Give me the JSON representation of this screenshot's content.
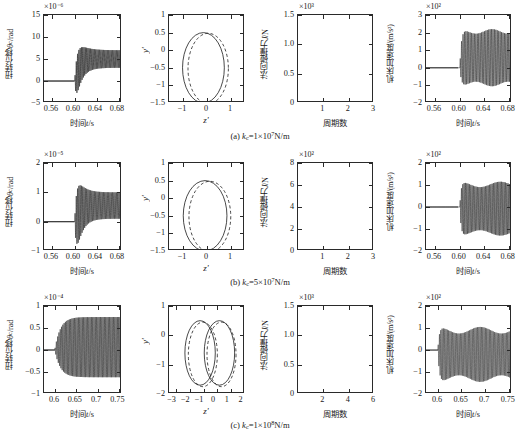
{
  "figure": {
    "columns": [
      "torsional-displacement",
      "phase-portrait",
      "normal-impact-force",
      "machine-acceleration"
    ],
    "rows": [
      "a",
      "b",
      "c"
    ]
  },
  "captions": {
    "a": "(a) kc=1×10⁷N/m",
    "b": "(b) kc=5×10⁷N/m",
    "c": "(c) kc=1×10⁸N/m",
    "a_prefix": "(a) ",
    "a_sym": "k",
    "a_sub": "c",
    "a_rest": "=1×10",
    "a_sup": "7",
    "a_unit": "N/m",
    "b_prefix": "(b) ",
    "b_sym": "k",
    "b_sub": "c",
    "b_rest": "=5×10",
    "b_sup": "7",
    "b_unit": "N/m",
    "c_prefix": "(c) ",
    "c_sym": "k",
    "c_sub": "c",
    "c_rest": "=1×10",
    "c_sup": "8",
    "c_unit": "N/m"
  },
  "labels": {
    "y_torsion": "扭转位移θc/rad",
    "y_torsion_cn": "扭转位移",
    "y_torsion_sym": "θ",
    "y_torsion_sub": "c",
    "y_torsion_unit": "/rad",
    "y_phase": "y'",
    "x_phase": "z'",
    "y_force_cn": "法向碰撞力",
    "y_force_sym": "J",
    "y_force_unit": "/N",
    "x_force": "周期数",
    "y_accel_cn": "机床加速度",
    "y_accel_unit": "/(m/s²)",
    "x_time_cn": "时间",
    "x_time_sym": "t",
    "x_time_unit": "/s"
  },
  "chart_data": [
    {
      "id": "a1",
      "row": "a",
      "col": 1,
      "type": "line",
      "title": "",
      "exponent": "×10⁻⁶",
      "xlabel": "时间t/s",
      "ylabel": "扭转位移θc/rad",
      "xlim": [
        0.545,
        0.685
      ],
      "ylim": [
        -5,
        15
      ],
      "xticks": [
        0.56,
        0.6,
        0.64,
        0.68
      ],
      "xticklabels": [
        "0.56",
        "0.60",
        "0.64",
        "0.68"
      ],
      "yticks": [
        -5,
        0,
        5,
        10,
        15
      ],
      "yticklabels": [
        "−5",
        "0",
        "5",
        "10",
        "15"
      ],
      "grid": false,
      "legend": "none",
      "description": "Flat zero until t=0.600 s, then high-frequency oscillation with initial peak 10.5 decaying to a steady band centered near 5 with amplitude about 2",
      "onset": 0.6,
      "peak_initial": 10.5,
      "steady_center": 5.0,
      "steady_amp": 2.0,
      "freq_hz": 430
    },
    {
      "id": "a2",
      "row": "a",
      "col": 2,
      "type": "line",
      "exponent": "",
      "xlabel": "z'",
      "ylabel": "y'",
      "xlim": [
        -1.6,
        1.6
      ],
      "ylim": [
        -1.5,
        1
      ],
      "xticks": [
        -1,
        0,
        1
      ],
      "xticklabels": [
        "−1",
        "0",
        "1"
      ],
      "yticks": [
        -1.5,
        -1,
        -0.5,
        0,
        0.5,
        1
      ],
      "yticklabels": [
        "−1.5",
        "−1",
        "−0.5",
        "0",
        "0.5",
        "1"
      ],
      "grid": false,
      "legend": "none",
      "series": [
        {
          "name": "solid-orbit",
          "style": "solid",
          "shape": "circle",
          "cx": -0.15,
          "cy": -0.5,
          "rx": 0.88,
          "ry": 1.0
        },
        {
          "name": "dashed-orbit",
          "style": "dashed",
          "shape": "circle",
          "cx": 0.05,
          "cy": -0.52,
          "rx": 0.85,
          "ry": 1.0
        }
      ]
    },
    {
      "id": "a3",
      "row": "a",
      "col": 3,
      "type": "line",
      "exponent": "×10³",
      "xlabel": "周期数",
      "ylabel": "法向碰撞力J/N",
      "xlim": [
        0,
        3
      ],
      "ylim": [
        0,
        1.5
      ],
      "xticks": [
        1,
        2,
        3
      ],
      "xticklabels": [
        "1",
        "2",
        "3"
      ],
      "yticks": [
        0,
        0.5,
        1,
        1.5
      ],
      "yticklabels": [
        "0",
        "0.5",
        "1.0",
        "1.5"
      ],
      "grid": false,
      "legend": "none",
      "pulses": [
        {
          "center": 0.48,
          "peak": 1.01,
          "width": 0.3
        },
        {
          "center": 1.45,
          "peak": 1.01,
          "width": 0.3
        },
        {
          "center": 2.43,
          "peak": 1.01,
          "width": 0.3
        }
      ]
    },
    {
      "id": "a4",
      "row": "a",
      "col": 4,
      "type": "line",
      "exponent": "×10²",
      "xlabel": "时间t/s",
      "ylabel": "机床加速度/(m/s²)",
      "xlim": [
        0.545,
        0.685
      ],
      "ylim": [
        -2,
        3
      ],
      "xticks": [
        0.56,
        0.6,
        0.64,
        0.68
      ],
      "xticklabels": [
        "0.56",
        "0.60",
        "0.64",
        "0.68"
      ],
      "yticks": [
        -2,
        -1,
        0,
        1,
        2,
        3
      ],
      "yticklabels": [
        "−2",
        "−1",
        "0",
        "1",
        "2",
        "3"
      ],
      "grid": false,
      "legend": "none",
      "description": "Zero until 0.600 s then dense oscillation band from about −1.0 to 2.2",
      "onset": 0.6,
      "band_top": 2.2,
      "band_bottom": -1.05,
      "freq_hz": 430
    },
    {
      "id": "b1",
      "row": "b",
      "col": 1,
      "type": "line",
      "exponent": "×10⁻⁵",
      "xlabel": "时间t/s",
      "ylabel": "扭转位移θc/rad",
      "xlim": [
        0.545,
        0.685
      ],
      "ylim": [
        -1,
        2
      ],
      "xticks": [
        0.56,
        0.6,
        0.64,
        0.68
      ],
      "xticklabels": [
        "0.56",
        "0.60",
        "0.64",
        "0.68"
      ],
      "yticks": [
        -1,
        0,
        1,
        2
      ],
      "yticklabels": [
        "−1",
        "0",
        "1",
        "2"
      ],
      "grid": false,
      "legend": "none",
      "description": "Flat zero until 0.600 s, transient burst peaking near 1.78 and dipping to −0.55, settling to band centered 0.55 amplitude 0.45",
      "onset": 0.6,
      "peak_initial": 1.78,
      "trough_initial": -0.55,
      "steady_center": 0.55,
      "steady_amp": 0.45,
      "freq_hz": 430
    },
    {
      "id": "b2",
      "row": "b",
      "col": 2,
      "type": "line",
      "exponent": "",
      "xlabel": "z'",
      "ylabel": "y'",
      "xlim": [
        -1.6,
        1.6
      ],
      "ylim": [
        -1.5,
        1
      ],
      "xticks": [
        -1,
        0,
        1
      ],
      "xticklabels": [
        "−1",
        "0",
        "1"
      ],
      "yticks": [
        -1.5,
        -1,
        -0.5,
        0,
        0.5,
        1
      ],
      "yticklabels": [
        "−1.5",
        "−1",
        "−0.5",
        "0",
        "0.5",
        "1"
      ],
      "grid": false,
      "legend": "none",
      "series": [
        {
          "name": "solid-orbit",
          "style": "solid",
          "shape": "circle",
          "cx": -0.08,
          "cy": -0.5,
          "rx": 0.92,
          "ry": 1.0
        },
        {
          "name": "dashed-orbit",
          "style": "dashed",
          "shape": "circle",
          "cx": 0.12,
          "cy": -0.52,
          "rx": 0.88,
          "ry": 1.0
        }
      ]
    },
    {
      "id": "b3",
      "row": "b",
      "col": 3,
      "type": "line",
      "exponent": "×10²",
      "xlabel": "周期数",
      "ylabel": "法向碰撞力J/N",
      "xlim": [
        0,
        3
      ],
      "ylim": [
        0,
        8
      ],
      "xticks": [
        1,
        2,
        3
      ],
      "xticklabels": [
        "1",
        "2",
        "3"
      ],
      "yticks": [
        0,
        2,
        4,
        6,
        8
      ],
      "yticklabels": [
        "0",
        "2",
        "4",
        "6",
        "8"
      ],
      "grid": false,
      "legend": "none",
      "pulses": [
        {
          "center": 0.47,
          "peak": 6.4,
          "width": 0.28
        },
        {
          "center": 1.45,
          "peak": 6.4,
          "width": 0.28
        },
        {
          "center": 2.42,
          "peak": 6.4,
          "width": 0.28
        }
      ]
    },
    {
      "id": "b4",
      "row": "b",
      "col": 4,
      "type": "line",
      "exponent": "×10²",
      "xlabel": "时间t/s",
      "ylabel": "机床加速度/(m/s²)",
      "xlim": [
        0.545,
        0.685
      ],
      "ylim": [
        -2,
        2
      ],
      "xticks": [
        0.56,
        0.6,
        0.64,
        0.68
      ],
      "xticklabels": [
        "0.56",
        "0.60",
        "0.64",
        "0.68"
      ],
      "yticks": [
        -2,
        -1,
        0,
        1,
        2
      ],
      "yticklabels": [
        "−2",
        "−1",
        "0",
        "1",
        "2"
      ],
      "grid": false,
      "legend": "none",
      "description": "Zero until 0.600 s then dense symmetric oscillation band −1.3 to 1.15",
      "onset": 0.6,
      "band_top": 1.15,
      "band_bottom": -1.3,
      "freq_hz": 460
    },
    {
      "id": "c1",
      "row": "c",
      "col": 1,
      "type": "line",
      "exponent": "×10⁻⁴",
      "xlabel": "时间t/s",
      "ylabel": "扭转位移θc/rad",
      "xlim": [
        0.575,
        0.757
      ],
      "ylim": [
        -1,
        1
      ],
      "xticks": [
        0.6,
        0.65,
        0.7,
        0.75
      ],
      "xticklabels": [
        "0.6",
        "0.65",
        "0.7",
        "0.75"
      ],
      "yticks": [
        -1,
        -0.5,
        0,
        0.5,
        1
      ],
      "yticklabels": [
        "−1",
        "−0.5",
        "0",
        "0.5",
        "1"
      ],
      "grid": false,
      "legend": "none",
      "description": "Zero until 0.600 s then growing symmetric oscillation saturating at about +0.75/−0.62",
      "onset": 0.6,
      "band_top": 0.75,
      "band_bottom": -0.62,
      "freq_hz": 330
    },
    {
      "id": "c2",
      "row": "c",
      "col": 2,
      "type": "line",
      "exponent": "",
      "xlabel": "z'",
      "ylabel": "y'",
      "xlim": [
        -3.5,
        2
      ],
      "ylim": [
        -2,
        1
      ],
      "xticks": [
        -3,
        -2,
        -1,
        0,
        1,
        2
      ],
      "xticklabels": [
        "−3",
        "−2",
        "−1",
        "0",
        "1",
        "2"
      ],
      "yticks": [
        -2,
        -1,
        0,
        1
      ],
      "yticklabels": [
        "−2",
        "−1",
        "0",
        "1"
      ],
      "grid": false,
      "legend": "none",
      "series": [
        {
          "name": "solid-orbit-left",
          "style": "solid",
          "shape": "loop",
          "cx": -1.25,
          "cy": -0.6,
          "rx": 1.1,
          "ry": 1.1
        },
        {
          "name": "solid-orbit-right",
          "style": "solid",
          "shape": "loop",
          "cx": 0.15,
          "cy": -0.6,
          "rx": 1.1,
          "ry": 1.1
        },
        {
          "name": "dashed-orbit-left",
          "style": "dashed",
          "shape": "loop",
          "cx": -1.05,
          "cy": -0.65,
          "rx": 1.05,
          "ry": 1.1
        },
        {
          "name": "dashed-orbit-right",
          "style": "dashed",
          "shape": "loop",
          "cx": 0.3,
          "cy": -0.65,
          "rx": 1.05,
          "ry": 1.1
        }
      ]
    },
    {
      "id": "c3",
      "row": "c",
      "col": 3,
      "type": "line",
      "exponent": "×10³",
      "xlabel": "周期数",
      "ylabel": "法向碰撞力J/N",
      "xlim": [
        0,
        6
      ],
      "ylim": [
        0,
        1.5
      ],
      "xticks": [
        2,
        4,
        6
      ],
      "xticklabels": [
        "2",
        "4",
        "6"
      ],
      "yticks": [
        0,
        0.5,
        1,
        1.5
      ],
      "yticklabels": [
        "0",
        "0.5",
        "1.0",
        "1.5"
      ],
      "grid": false,
      "legend": "none",
      "pulses": [
        {
          "center": 0.62,
          "peak": 1.1,
          "width": 0.62
        },
        {
          "center": 2.42,
          "peak": 1.13,
          "width": 0.62
        },
        {
          "center": 4.3,
          "peak": 1.13,
          "width": 0.62
        }
      ]
    },
    {
      "id": "c4",
      "row": "c",
      "col": 4,
      "type": "line",
      "exponent": "×10²",
      "xlabel": "时间t/s",
      "ylabel": "机床加速度/(m/s²)",
      "xlim": [
        0.575,
        0.757
      ],
      "ylim": [
        -2,
        2
      ],
      "xticks": [
        0.6,
        0.65,
        0.7,
        0.75
      ],
      "xticklabels": [
        "0.6",
        "0.65",
        "0.7",
        "0.75"
      ],
      "yticks": [
        -2,
        -1,
        0,
        1,
        2
      ],
      "yticklabels": [
        "−2",
        "−1",
        "0",
        "1",
        "2"
      ],
      "grid": false,
      "legend": "none",
      "description": "Zero until 0.600 s then dense band from −1.45 to 1.05",
      "onset": 0.6,
      "band_top": 1.05,
      "band_bottom": -1.45,
      "freq_hz": 360
    }
  ]
}
